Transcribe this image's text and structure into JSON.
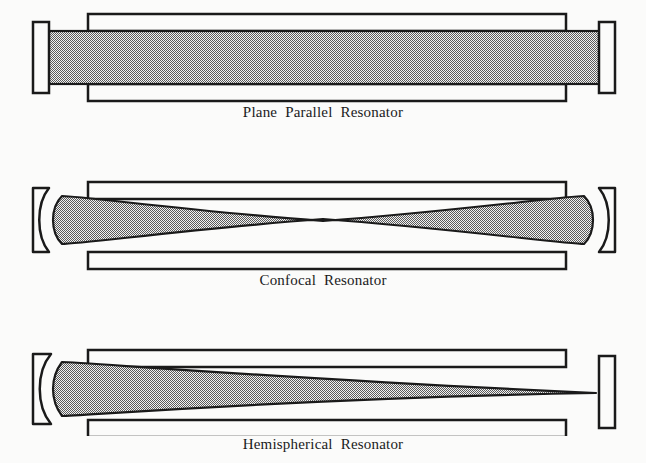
{
  "document": {
    "title": "Laser Resonator Configurations",
    "background_color": "#fbfbfa",
    "ink_color": "#1a1a1a",
    "fill_color": "#a8a8a8"
  },
  "figures": [
    {
      "id": "plane-parallel",
      "caption": "Plane Parallel Resonator",
      "left_mirror": "flat",
      "right_mirror": "flat",
      "beam_shape": "uniform-rectangular",
      "description": "Two flat parallel mirrors with a uniform cylindrical beam filling the cavity"
    },
    {
      "id": "confocal",
      "caption": "Confocal Resonator",
      "left_mirror": "concave",
      "right_mirror": "concave",
      "beam_shape": "hourglass-waist",
      "description": "Two concave mirrors with the beam focused to a waist at the cavity center"
    },
    {
      "id": "hemispherical",
      "caption": "Hemispherical Resonator",
      "left_mirror": "concave",
      "right_mirror": "flat",
      "beam_shape": "tapered-cone",
      "description": "One concave and one flat mirror with the beam tapering to a point at the flat mirror"
    }
  ]
}
